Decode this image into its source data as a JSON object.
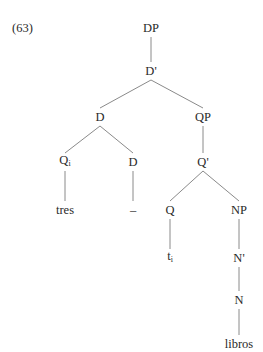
{
  "example_number": "(63)",
  "tree": {
    "nodes": [
      {
        "id": "DP",
        "label": "DP",
        "sub": "",
        "x": 151,
        "y": 28
      },
      {
        "id": "Dbar",
        "label": "D'",
        "sub": "",
        "x": 151,
        "y": 71
      },
      {
        "id": "D1",
        "label": "D",
        "sub": "",
        "x": 100,
        "y": 117
      },
      {
        "id": "QP",
        "label": "QP",
        "sub": "",
        "x": 203,
        "y": 117
      },
      {
        "id": "Qi",
        "label": "Q",
        "sub": "i",
        "x": 65,
        "y": 162
      },
      {
        "id": "D2",
        "label": "D",
        "sub": "",
        "x": 133,
        "y": 162
      },
      {
        "id": "Qbar",
        "label": "Q'",
        "sub": "",
        "x": 203,
        "y": 162
      },
      {
        "id": "tres",
        "label": "tres",
        "sub": "",
        "x": 65,
        "y": 210
      },
      {
        "id": "dash",
        "label": "–",
        "sub": "",
        "x": 133,
        "y": 210
      },
      {
        "id": "Q",
        "label": "Q",
        "sub": "",
        "x": 170,
        "y": 210
      },
      {
        "id": "NP",
        "label": "NP",
        "sub": "",
        "x": 239,
        "y": 210
      },
      {
        "id": "ti",
        "label": "t",
        "sub": "i",
        "x": 170,
        "y": 258
      },
      {
        "id": "Nbar",
        "label": "N'",
        "sub": "",
        "x": 239,
        "y": 258
      },
      {
        "id": "N",
        "label": "N",
        "sub": "",
        "x": 239,
        "y": 300
      },
      {
        "id": "libros",
        "label": "libros",
        "sub": "",
        "x": 239,
        "y": 344
      }
    ],
    "edges": [
      [
        "DP",
        "Dbar"
      ],
      [
        "Dbar",
        "D1"
      ],
      [
        "Dbar",
        "QP"
      ],
      [
        "D1",
        "Qi"
      ],
      [
        "D1",
        "D2"
      ],
      [
        "QP",
        "Qbar"
      ],
      [
        "Qi",
        "tres"
      ],
      [
        "D2",
        "dash"
      ],
      [
        "Qbar",
        "Q"
      ],
      [
        "Qbar",
        "NP"
      ],
      [
        "Q",
        "ti"
      ],
      [
        "NP",
        "Nbar"
      ],
      [
        "Nbar",
        "N"
      ],
      [
        "N",
        "libros"
      ]
    ]
  }
}
